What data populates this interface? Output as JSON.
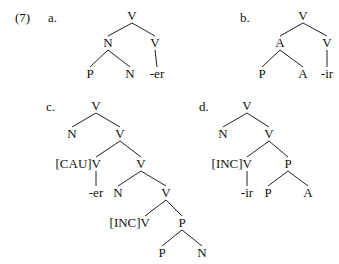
{
  "example_number": "(7)",
  "trees": [
    {
      "id": "a",
      "label": "a.",
      "label_pos": [
        48,
        22
      ],
      "nodes": [
        {
          "id": "a0",
          "text": "V",
          "x": 132,
          "y": 20
        },
        {
          "id": "a1",
          "text": "N",
          "x": 108,
          "y": 47
        },
        {
          "id": "a2",
          "text": "V",
          "x": 155,
          "y": 47
        },
        {
          "id": "a3",
          "text": "P",
          "x": 90,
          "y": 78
        },
        {
          "id": "a4",
          "text": "N",
          "x": 130,
          "y": 78
        },
        {
          "id": "a5",
          "text": "-er",
          "x": 157,
          "y": 78
        }
      ],
      "edges": [
        [
          "a0",
          "a1"
        ],
        [
          "a0",
          "a2"
        ],
        [
          "a1",
          "a3"
        ],
        [
          "a1",
          "a4"
        ],
        [
          "a2",
          "a5"
        ]
      ]
    },
    {
      "id": "b",
      "label": "b.",
      "label_pos": [
        240,
        22
      ],
      "nodes": [
        {
          "id": "b0",
          "text": "V",
          "x": 303,
          "y": 20
        },
        {
          "id": "b1",
          "text": "A",
          "x": 280,
          "y": 47
        },
        {
          "id": "b2",
          "text": "V",
          "x": 327,
          "y": 47
        },
        {
          "id": "b3",
          "text": "P",
          "x": 262,
          "y": 78
        },
        {
          "id": "b4",
          "text": "A",
          "x": 303,
          "y": 78
        },
        {
          "id": "b5",
          "text": "-ir",
          "x": 327,
          "y": 78
        }
      ],
      "edges": [
        [
          "b0",
          "b1"
        ],
        [
          "b0",
          "b2"
        ],
        [
          "b1",
          "b3"
        ],
        [
          "b1",
          "b4"
        ],
        [
          "b2",
          "b5"
        ]
      ]
    },
    {
      "id": "c",
      "label": "c.",
      "label_pos": [
        46,
        111
      ],
      "nodes": [
        {
          "id": "c0",
          "text": "V",
          "x": 96,
          "y": 110
        },
        {
          "id": "c1",
          "text": "N",
          "x": 72,
          "y": 138
        },
        {
          "id": "c2",
          "text": "V",
          "x": 120,
          "y": 138
        },
        {
          "id": "c3",
          "text": "[CAU]V",
          "x": 80,
          "y": 168,
          "anchor_x": 96
        },
        {
          "id": "c4",
          "text": "V",
          "x": 141,
          "y": 168
        },
        {
          "id": "c5",
          "text": "-er",
          "x": 96,
          "y": 197
        },
        {
          "id": "c6",
          "text": "N",
          "x": 118,
          "y": 197
        },
        {
          "id": "c7",
          "text": "V",
          "x": 166,
          "y": 197
        },
        {
          "id": "c8",
          "text": "[INC]V",
          "x": 128,
          "y": 227,
          "anchor_x": 145
        },
        {
          "id": "c9",
          "text": "P",
          "x": 182,
          "y": 227
        },
        {
          "id": "c10",
          "text": "P",
          "x": 162,
          "y": 257
        },
        {
          "id": "c11",
          "text": "N",
          "x": 202,
          "y": 257
        }
      ],
      "edges": [
        [
          "c0",
          "c1"
        ],
        [
          "c0",
          "c2"
        ],
        [
          "c2",
          "c3"
        ],
        [
          "c2",
          "c4"
        ],
        [
          "c3",
          "c5"
        ],
        [
          "c4",
          "c6"
        ],
        [
          "c4",
          "c7"
        ],
        [
          "c7",
          "c8"
        ],
        [
          "c7",
          "c9"
        ],
        [
          "c9",
          "c10"
        ],
        [
          "c9",
          "c11"
        ]
      ]
    },
    {
      "id": "d",
      "label": "d.",
      "label_pos": [
        199,
        111
      ],
      "nodes": [
        {
          "id": "d0",
          "text": "V",
          "x": 247,
          "y": 110
        },
        {
          "id": "d1",
          "text": "N",
          "x": 223,
          "y": 138
        },
        {
          "id": "d2",
          "text": "V",
          "x": 269,
          "y": 138
        },
        {
          "id": "d3",
          "text": "[INC]V",
          "x": 231,
          "y": 168,
          "anchor_x": 247
        },
        {
          "id": "d4",
          "text": "P",
          "x": 288,
          "y": 168
        },
        {
          "id": "d5",
          "text": "-ir",
          "x": 247,
          "y": 197
        },
        {
          "id": "d6",
          "text": "P",
          "x": 268,
          "y": 197
        },
        {
          "id": "d7",
          "text": "A",
          "x": 308,
          "y": 197
        }
      ],
      "edges": [
        [
          "d0",
          "d1"
        ],
        [
          "d0",
          "d2"
        ],
        [
          "d2",
          "d3"
        ],
        [
          "d2",
          "d4"
        ],
        [
          "d3",
          "d5"
        ],
        [
          "d4",
          "d6"
        ],
        [
          "d4",
          "d7"
        ]
      ]
    }
  ]
}
